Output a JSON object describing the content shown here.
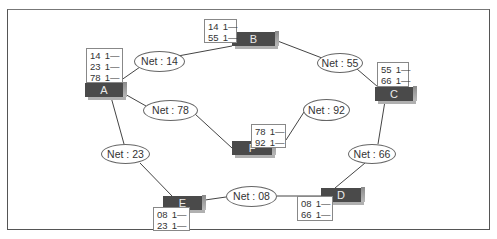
{
  "diagram": {
    "title_clipped": "",
    "nodes": [
      {
        "id": "A",
        "label": "A",
        "table": [
          [
            "14",
            "1—"
          ],
          [
            "23",
            "1—"
          ],
          [
            "78",
            "1—"
          ]
        ]
      },
      {
        "id": "B",
        "label": "B",
        "table": [
          [
            "14",
            "1—"
          ],
          [
            "55",
            "1—"
          ]
        ]
      },
      {
        "id": "C",
        "label": "C",
        "table": [
          [
            "55",
            "1—"
          ],
          [
            "66",
            "1—"
          ]
        ]
      },
      {
        "id": "D",
        "label": "D",
        "table": [
          [
            "08",
            "1—"
          ],
          [
            "66",
            "1—"
          ]
        ]
      },
      {
        "id": "E",
        "label": "E",
        "table": [
          [
            "08",
            "1—"
          ],
          [
            "23",
            "1—"
          ]
        ]
      },
      {
        "id": "F",
        "label": "F",
        "table": [
          [
            "78",
            "1—"
          ],
          [
            "92",
            "1—"
          ]
        ]
      }
    ],
    "networks": [
      {
        "id": "14",
        "label": "Net : 14",
        "connects": [
          "A",
          "B"
        ]
      },
      {
        "id": "55",
        "label": "Net : 55",
        "connects": [
          "B",
          "C"
        ]
      },
      {
        "id": "78",
        "label": "Net : 78",
        "connects": [
          "A",
          "F"
        ]
      },
      {
        "id": "92",
        "label": "Net : 92",
        "connects": [
          "F"
        ]
      },
      {
        "id": "23",
        "label": "Net : 23",
        "connects": [
          "A",
          "E"
        ]
      },
      {
        "id": "66",
        "label": "Net : 66",
        "connects": [
          "C",
          "D"
        ]
      },
      {
        "id": "08",
        "label": "Net : 08",
        "connects": [
          "E",
          "D"
        ]
      }
    ]
  }
}
